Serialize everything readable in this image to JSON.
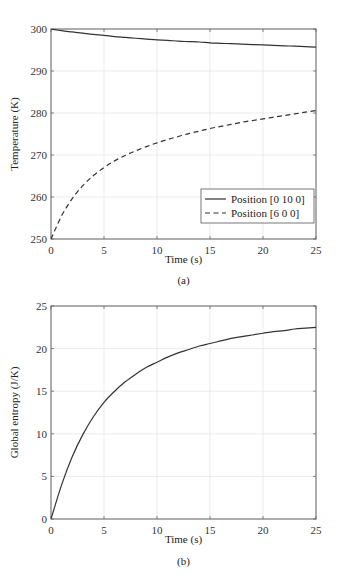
{
  "chart_data": [
    {
      "id": "a",
      "type": "line",
      "caption": "(a)",
      "title": "",
      "xlabel": "Time (s)",
      "ylabel": "Temperature (K)",
      "xlim": [
        0,
        25
      ],
      "ylim": [
        250,
        300
      ],
      "xticks": [
        0,
        5,
        10,
        15,
        20,
        25
      ],
      "yticks": [
        250,
        260,
        270,
        280,
        290,
        300
      ],
      "grid": true,
      "legend_position": "lower right",
      "x": [
        0,
        1,
        2,
        3,
        4,
        5,
        6,
        7,
        8,
        9,
        10,
        11,
        12,
        13,
        14,
        15,
        16,
        17,
        18,
        19,
        20,
        21,
        22,
        23,
        24,
        25
      ],
      "series": [
        {
          "name": "Position [0 10 0]",
          "style": "solid",
          "values": [
            300.0,
            299.6,
            299.3,
            299.0,
            298.7,
            298.5,
            298.2,
            298.0,
            297.8,
            297.6,
            297.4,
            297.3,
            297.1,
            297.0,
            296.9,
            296.7,
            296.6,
            296.5,
            296.4,
            296.3,
            296.2,
            296.1,
            296.0,
            295.9,
            295.8,
            295.7
          ]
        },
        {
          "name": "Position [6 0 0]",
          "style": "dashed",
          "values": [
            250.0,
            255.5,
            259.6,
            262.7,
            265.1,
            267.0,
            268.6,
            269.9,
            271.0,
            272.0,
            272.9,
            273.7,
            274.4,
            275.1,
            275.7,
            276.3,
            276.8,
            277.3,
            277.8,
            278.2,
            278.6,
            279.0,
            279.4,
            279.8,
            280.2,
            280.6
          ]
        }
      ]
    },
    {
      "id": "b",
      "type": "line",
      "caption": "(b)",
      "title": "",
      "xlabel": "Time (s)",
      "ylabel": "Global entropy (J/K)",
      "xlim": [
        0,
        25
      ],
      "ylim": [
        0,
        25
      ],
      "xticks": [
        0,
        5,
        10,
        15,
        20,
        25
      ],
      "yticks": [
        0,
        5,
        10,
        15,
        20,
        25
      ],
      "grid": true,
      "legend_position": "none",
      "x": [
        0,
        1,
        2,
        3,
        4,
        5,
        6,
        7,
        8,
        9,
        10,
        11,
        12,
        13,
        14,
        15,
        16,
        17,
        18,
        19,
        20,
        21,
        22,
        23,
        24,
        25
      ],
      "series": [
        {
          "name": "Global entropy",
          "style": "solid",
          "values": [
            0.0,
            4.0,
            7.3,
            9.9,
            12.0,
            13.7,
            15.0,
            16.1,
            17.0,
            17.8,
            18.4,
            19.0,
            19.5,
            19.9,
            20.3,
            20.6,
            20.9,
            21.2,
            21.4,
            21.6,
            21.8,
            22.0,
            22.1,
            22.3,
            22.4,
            22.5
          ]
        }
      ]
    }
  ]
}
